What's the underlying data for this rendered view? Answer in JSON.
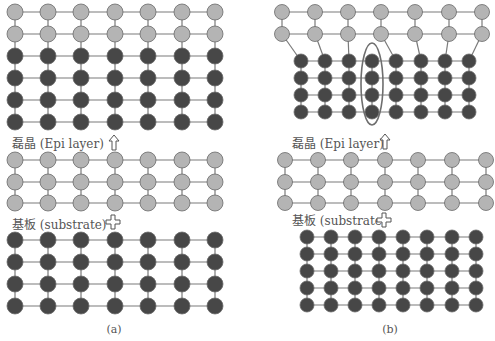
{
  "colors": {
    "epi_atom": "#b4b4b4",
    "substrate_atom": "#474747",
    "atom_stroke": "#6a6a6a",
    "bond": "#7a7a7a",
    "ellipse": "#6e6e6e",
    "text": "#555555"
  },
  "panel_a": {
    "caption": "(a)",
    "epi_label": "磊晶 (Epi layer)",
    "substrate_label": "基板 (substrate)",
    "arrow_icon": "up-arrow-icon",
    "plus_icon": "plus-icon",
    "grown_stack": {
      "cols_x": [
        15,
        48,
        81,
        115,
        148,
        182,
        215
      ],
      "light_rows_y": [
        12,
        34
      ],
      "dark_rows_y": [
        56,
        78,
        100,
        122
      ]
    },
    "epi_block": {
      "cols_x": [
        15,
        48,
        81,
        115,
        148,
        182,
        215
      ],
      "rows_y": [
        160,
        182,
        203
      ]
    },
    "substrate_block": {
      "cols_x": [
        15,
        48,
        81,
        115,
        148,
        182,
        215
      ],
      "rows_y": [
        240,
        262,
        284,
        306
      ]
    }
  },
  "panel_b": {
    "caption": "(b)",
    "epi_label": "磊晶 (Epi layer)",
    "substrate_label": "基板 (substrate)",
    "arrow_icon": "up-arrow-icon",
    "plus_icon": "plus-icon",
    "grown_stack": {
      "light_cols_x": [
        282,
        315,
        348,
        381,
        415,
        449,
        482
      ],
      "light_rows_y": [
        12,
        34
      ],
      "dark_cols_x": [
        301,
        325,
        349,
        372,
        396,
        421,
        445,
        469
      ],
      "dark_rows_y": [
        61,
        78,
        95,
        112
      ],
      "highlight_ellipse": {
        "cx": 372,
        "cy": 84,
        "rx": 11,
        "ry": 41
      }
    },
    "epi_block": {
      "cols_x": [
        285,
        318,
        351,
        385,
        418,
        452,
        486
      ],
      "rows_y": [
        160,
        182,
        203
      ]
    },
    "substrate_block": {
      "cols_x": [
        307,
        331,
        355,
        379,
        403,
        427,
        452,
        476
      ],
      "rows_y": [
        237,
        254,
        271,
        288,
        305
      ]
    }
  }
}
